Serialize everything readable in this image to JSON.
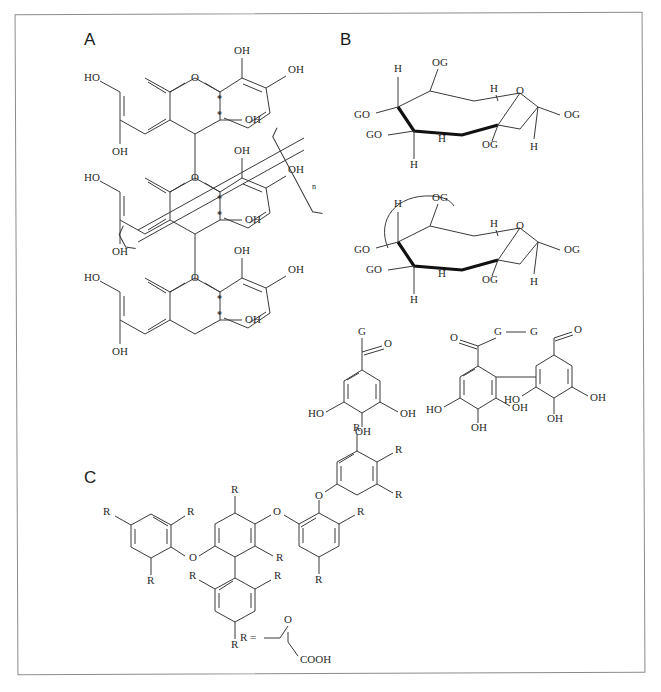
{
  "figure": {
    "width": 661,
    "height": 692,
    "background": "#ffffff",
    "border_color": "#8c8c8c",
    "bond_color": "#3a3a3a",
    "bold_bond_color": "#111111",
    "text_color": "#2a2a2a"
  },
  "panels": [
    {
      "id": "A",
      "label": "A",
      "caption": "",
      "subject": "condensed tannin (proanthocyanidin) polymer of catechin units"
    },
    {
      "id": "B",
      "label": "B",
      "caption": "",
      "subject": "hydrolysable tannin: galloylated glucose chair conformations and galloyl / digalloyl units"
    },
    {
      "id": "C",
      "label": "C",
      "caption": "",
      "subject": "polyphenolic diaryl-ether network with carboxymethyl substituents"
    }
  ],
  "labels": {
    "OH": "OH",
    "HO": "HO",
    "O": "O",
    "H": "H",
    "OG": "OG",
    "GO": "GO",
    "G": "G",
    "R": "R",
    "n": "n",
    "star": "*",
    "R_equals": "R =",
    "COOH": "COOH",
    "G_G": "G"
  },
  "panel_a": {
    "label": "A",
    "repeat_subscript": "n",
    "stereocenter_marker": "*",
    "units": [
      {
        "name": "catechin-unit-top",
        "substituents": [
          "HO",
          "OH",
          "OH",
          "OH",
          "OH",
          "O"
        ],
        "stereocenters": 2
      },
      {
        "name": "catechin-unit-middle",
        "substituents": [
          "HO",
          "OH",
          "OH",
          "OH",
          "OH",
          "O"
        ],
        "stereocenters": 2
      },
      {
        "name": "catechin-unit-bottom",
        "substituents": [
          "HO",
          "OH",
          "OH",
          "OH",
          "OH",
          "O"
        ],
        "stereocenters": 2
      }
    ]
  },
  "panel_b": {
    "label": "B",
    "sugars": [
      {
        "name": "pentagalloyl-glucose",
        "ring_oxygen": "O",
        "substituents": [
          "OG",
          "GO",
          "GO",
          "OG",
          "OG"
        ],
        "hydrogens": [
          "H",
          "H",
          "H",
          "H",
          "H"
        ],
        "has_crosslink_arc": false
      },
      {
        "name": "glucose-with-HHDP-crosslink",
        "ring_oxygen": "O",
        "substituents": [
          "OG",
          "GO",
          "GO",
          "OG",
          "OG"
        ],
        "hydrogens": [
          "H",
          "H",
          "H",
          "H",
          "H"
        ],
        "has_crosslink_arc": true
      }
    ],
    "galloyl_definition": {
      "name": "galloyl-group",
      "symbol": "G",
      "carbonyl": "O",
      "ring_substituents": [
        "HO",
        "OH",
        "OH"
      ]
    },
    "digalloyl_definition": {
      "name": "hexahydroxydiphenoyl-group",
      "symbol_left": "G",
      "symbol_right": "G",
      "carbonyl_left": "O",
      "carbonyl_right": "O",
      "ring_substituents_left": [
        "HO",
        "OH",
        "OH"
      ],
      "ring_substituents_right": [
        "HO",
        "OH",
        "OH"
      ]
    }
  },
  "panel_c": {
    "label": "C",
    "ring_count": 5,
    "substituent_symbol": "R",
    "ether_oxygen": "O",
    "r_definition": {
      "prefix": "R =",
      "oxygen": "O",
      "terminal": "COOH"
    },
    "r_positions_count": 13
  }
}
